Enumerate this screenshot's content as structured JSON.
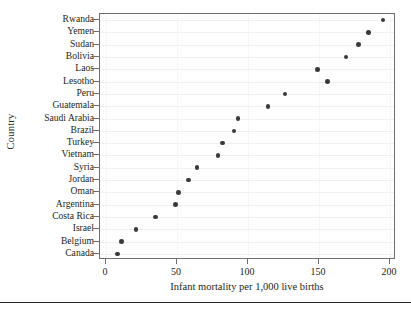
{
  "chart_data": {
    "type": "scatter",
    "title": "",
    "xlabel": "Infant mortality per 1,000 live births",
    "ylabel": "Country",
    "grid": true,
    "legend": null,
    "xlim": [
      0,
      200
    ],
    "xticks": [
      0,
      50,
      100,
      150,
      200
    ],
    "xtick_labels": [
      "0",
      "50",
      "100",
      "150",
      "200"
    ],
    "categories": [
      "Rwanda",
      "Yemen",
      "Sudan",
      "Bolivia",
      "Laos",
      "Lesotho",
      "Peru",
      "Guatemala",
      "Saudi Arabia",
      "Brazil",
      "Turkey",
      "Vietnam",
      "Syria",
      "Jordan",
      "Oman",
      "Argentina",
      "Costa Rica",
      "Israel",
      "Belgium",
      "Canada"
    ],
    "values": [
      195,
      185,
      178,
      169,
      149,
      156,
      126,
      114,
      93,
      90,
      82,
      79,
      64,
      58,
      51,
      49,
      35,
      21,
      11,
      8
    ],
    "marker": {
      "shape": "circle",
      "color": "#3a3a3a",
      "size": 4.6
    },
    "axis_color": "#6e6e6e",
    "gridline_color": "#f1f1f1",
    "background": "#ffffff"
  }
}
